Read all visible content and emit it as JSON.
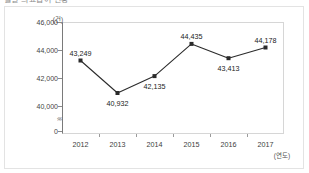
{
  "header": {
    "cropped_text": "월별 의료급여 현황"
  },
  "chart_data": {
    "type": "line",
    "title": "",
    "subtitle": "",
    "xlabel": "(연도)",
    "ylabel": "(건)",
    "categories": [
      "2012",
      "2013",
      "2014",
      "2015",
      "2016",
      "2017"
    ],
    "values": [
      43249,
      40932,
      42135,
      44435,
      43413,
      44178
    ],
    "value_labels": [
      "43,249",
      "40,932",
      "42,135",
      "44,435",
      "43,413",
      "44,178"
    ],
    "label_positions": [
      "above",
      "below",
      "below",
      "above",
      "below",
      "above"
    ],
    "ylim": [
      39000,
      46000
    ],
    "yticks": [
      0,
      40000,
      42000,
      44000,
      46000
    ],
    "ytick_labels": [
      "0",
      "40,000",
      "42,000",
      "44,000",
      "46,000"
    ],
    "axis_break": true,
    "axis_break_symbol": "≈",
    "grid": false,
    "legend": null,
    "series_color": "#2b2b2b",
    "marker": "square"
  },
  "colors": {
    "line": "#2b2b2b",
    "marker": "#111111",
    "plot_border": "#d6d6d6",
    "axis": "#7a7a7a",
    "outer_frame": "#e3e3e3",
    "background": "#ffffff",
    "tick_text": "#444444"
  }
}
